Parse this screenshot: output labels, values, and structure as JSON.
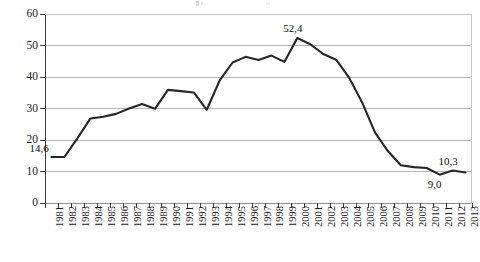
{
  "chart_data": {
    "type": "line",
    "title": "",
    "xlabel": "",
    "ylabel": "",
    "ylim": [
      0,
      60
    ],
    "ytick_values": [
      0,
      10,
      20,
      30,
      40,
      50,
      60
    ],
    "ytick_labels": [
      "0",
      "10",
      "20",
      "30",
      "40",
      "50",
      "60"
    ],
    "grid": true,
    "legend": "none",
    "decimal_separator": ",",
    "categories": [
      "1981",
      "1982",
      "1983",
      "1984",
      "1985",
      "1986",
      "1987",
      "1988",
      "1989",
      "1990",
      "1991",
      "1992",
      "1993",
      "1994",
      "1995",
      "1996",
      "1997",
      "1998",
      "1999",
      "2000",
      "2001",
      "2002",
      "2003",
      "2004",
      "2005",
      "2006",
      "2007",
      "2008",
      "2009",
      "2010",
      "2011",
      "2012",
      "2013"
    ],
    "values": [
      14.6,
      14.6,
      20.5,
      26.8,
      27.4,
      28.3,
      30.0,
      31.4,
      29.9,
      35.9,
      35.5,
      35.1,
      29.6,
      38.9,
      44.6,
      46.4,
      45.4,
      46.8,
      44.8,
      52.4,
      50.4,
      47.3,
      45.5,
      39.8,
      32.0,
      22.4,
      16.5,
      12.0,
      11.4,
      11.1,
      9.0,
      10.3,
      9.7
    ],
    "series": [
      {
        "name": "series-1",
        "color": "#262626",
        "values": [
          14.6,
          14.6,
          20.5,
          26.8,
          27.4,
          28.3,
          30.0,
          31.4,
          29.9,
          35.9,
          35.5,
          35.1,
          29.6,
          38.9,
          44.6,
          46.4,
          45.4,
          46.8,
          44.8,
          52.4,
          50.4,
          47.3,
          45.5,
          39.8,
          32.0,
          22.4,
          16.5,
          12.0,
          11.4,
          11.1,
          9.0,
          10.3,
          9.7
        ]
      }
    ],
    "annotations": [
      {
        "category": "1981",
        "value": 14.6,
        "text": "14,6",
        "position": "above-right"
      },
      {
        "category": "2000",
        "value": 52.4,
        "text": "52,4",
        "position": "above"
      },
      {
        "category": "2011",
        "value": 9.0,
        "text": "9,0",
        "position": "below"
      },
      {
        "category": "2012",
        "value": 10.3,
        "text": "10,3",
        "position": "above"
      }
    ]
  },
  "colors": {
    "line": "#262626",
    "grid": "#b3b3b3",
    "axis": "#3a3a3a",
    "text": "#1a1a1a",
    "background": "#ffffff"
  }
}
